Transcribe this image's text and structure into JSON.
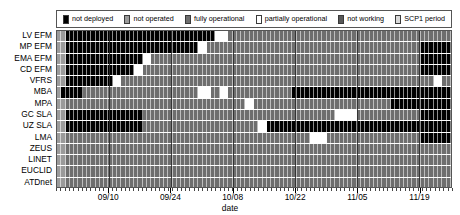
{
  "legend": {
    "items": [
      {
        "label": "not deployed",
        "color": "#000000",
        "name": "legend-not-deployed"
      },
      {
        "label": "not operated",
        "color": "#9a9a9a",
        "name": "legend-not-operated"
      },
      {
        "label": "fully operational",
        "color": "#6e6e6e",
        "name": "legend-fully-operational"
      },
      {
        "label": "partially operational",
        "color": "#ffffff",
        "name": "legend-partially-operational"
      },
      {
        "label": "not working",
        "color": "#585858",
        "name": "legend-not-working"
      },
      {
        "label": "SCP1 period",
        "color": "#d9d9d9",
        "name": "legend-scp1-period"
      }
    ]
  },
  "axes": {
    "xlabel": "date",
    "xticks": [
      "09/10",
      "09/24",
      "10/08",
      "10/22",
      "11/05",
      "11/19"
    ],
    "xtick_positions": [
      0.132,
      0.289,
      0.446,
      0.604,
      0.761,
      0.918
    ],
    "minor_tick_count": 92,
    "ylabels": [
      "LV EFM",
      "MP EFM",
      "EMA EFM",
      "CD EFM",
      "VFRS",
      "MBA",
      "MPA",
      "GC SLA",
      "UZ SLA",
      "LMA",
      "ZEUS",
      "LINET",
      "EUCLID",
      "ATDnet"
    ]
  },
  "chart_data": {
    "type": "heatmap",
    "title": "",
    "xlabel": "date",
    "ylabel": "",
    "grid": true,
    "legend_position": "top",
    "x_start": "09/03",
    "x_end": "11/28",
    "n_days": 92,
    "status_colors": {
      "not_deployed": "#000000",
      "not_operated": "#9a9a9a",
      "fully_operational": "#6e6e6e",
      "partially_operational": "#ffffff",
      "not_working": "#585858",
      "scp1_period": "#d9d9d9"
    },
    "categories": [
      "LV EFM",
      "MP EFM",
      "EMA EFM",
      "CD EFM",
      "VFRS",
      "MBA",
      "MPA",
      "GC SLA",
      "UZ SLA",
      "LMA",
      "ZEUS",
      "LINET",
      "EUCLID",
      "ATDnet"
    ],
    "series": [
      {
        "name": "LV EFM",
        "segments": [
          {
            "start": 0,
            "end": 2,
            "status": "not_operated"
          },
          {
            "start": 2,
            "end": 37,
            "status": "not_deployed"
          },
          {
            "start": 37,
            "end": 40,
            "status": "partially_operational"
          },
          {
            "start": 40,
            "end": 92,
            "status": "fully_operational"
          }
        ]
      },
      {
        "name": "MP EFM",
        "segments": [
          {
            "start": 0,
            "end": 2,
            "status": "not_operated"
          },
          {
            "start": 2,
            "end": 33,
            "status": "not_deployed"
          },
          {
            "start": 33,
            "end": 35,
            "status": "partially_operational"
          },
          {
            "start": 35,
            "end": 85,
            "status": "fully_operational"
          },
          {
            "start": 85,
            "end": 92,
            "status": "not_deployed"
          }
        ]
      },
      {
        "name": "EMA EFM",
        "segments": [
          {
            "start": 0,
            "end": 2,
            "status": "not_operated"
          },
          {
            "start": 2,
            "end": 20,
            "status": "not_deployed"
          },
          {
            "start": 20,
            "end": 22,
            "status": "partially_operational"
          },
          {
            "start": 22,
            "end": 85,
            "status": "fully_operational"
          },
          {
            "start": 85,
            "end": 92,
            "status": "not_deployed"
          }
        ]
      },
      {
        "name": "CD EFM",
        "segments": [
          {
            "start": 0,
            "end": 2,
            "status": "not_operated"
          },
          {
            "start": 2,
            "end": 18,
            "status": "not_deployed"
          },
          {
            "start": 18,
            "end": 20,
            "status": "partially_operational"
          },
          {
            "start": 20,
            "end": 85,
            "status": "fully_operational"
          },
          {
            "start": 85,
            "end": 92,
            "status": "not_deployed"
          }
        ]
      },
      {
        "name": "VFRS",
        "segments": [
          {
            "start": 0,
            "end": 2,
            "status": "not_operated"
          },
          {
            "start": 2,
            "end": 13,
            "status": "not_deployed"
          },
          {
            "start": 13,
            "end": 15,
            "status": "partially_operational"
          },
          {
            "start": 15,
            "end": 88,
            "status": "fully_operational"
          },
          {
            "start": 88,
            "end": 90,
            "status": "partially_operational"
          },
          {
            "start": 90,
            "end": 92,
            "status": "fully_operational"
          }
        ]
      },
      {
        "name": "MBA",
        "segments": [
          {
            "start": 0,
            "end": 1,
            "status": "not_operated"
          },
          {
            "start": 1,
            "end": 6,
            "status": "not_deployed"
          },
          {
            "start": 6,
            "end": 33,
            "status": "fully_operational"
          },
          {
            "start": 33,
            "end": 36,
            "status": "partially_operational"
          },
          {
            "start": 36,
            "end": 38,
            "status": "fully_operational"
          },
          {
            "start": 38,
            "end": 40,
            "status": "partially_operational"
          },
          {
            "start": 40,
            "end": 55,
            "status": "fully_operational"
          },
          {
            "start": 55,
            "end": 92,
            "status": "not_deployed"
          }
        ]
      },
      {
        "name": "MPA",
        "segments": [
          {
            "start": 0,
            "end": 2,
            "status": "not_operated"
          },
          {
            "start": 2,
            "end": 44,
            "status": "fully_operational"
          },
          {
            "start": 44,
            "end": 46,
            "status": "partially_operational"
          },
          {
            "start": 46,
            "end": 78,
            "status": "fully_operational"
          },
          {
            "start": 78,
            "end": 92,
            "status": "not_deployed"
          }
        ]
      },
      {
        "name": "GC SLA",
        "segments": [
          {
            "start": 0,
            "end": 2,
            "status": "not_operated"
          },
          {
            "start": 2,
            "end": 20,
            "status": "not_deployed"
          },
          {
            "start": 20,
            "end": 65,
            "status": "fully_operational"
          },
          {
            "start": 65,
            "end": 70,
            "status": "partially_operational"
          },
          {
            "start": 70,
            "end": 85,
            "status": "fully_operational"
          },
          {
            "start": 85,
            "end": 92,
            "status": "not_deployed"
          }
        ]
      },
      {
        "name": "UZ SLA",
        "segments": [
          {
            "start": 0,
            "end": 2,
            "status": "not_operated"
          },
          {
            "start": 2,
            "end": 20,
            "status": "not_deployed"
          },
          {
            "start": 20,
            "end": 47,
            "status": "fully_operational"
          },
          {
            "start": 47,
            "end": 49,
            "status": "partially_operational"
          },
          {
            "start": 49,
            "end": 92,
            "status": "not_deployed"
          }
        ]
      },
      {
        "name": "LMA",
        "segments": [
          {
            "start": 0,
            "end": 2,
            "status": "not_operated"
          },
          {
            "start": 2,
            "end": 59,
            "status": "fully_operational"
          },
          {
            "start": 59,
            "end": 63,
            "status": "partially_operational"
          },
          {
            "start": 63,
            "end": 85,
            "status": "fully_operational"
          },
          {
            "start": 85,
            "end": 92,
            "status": "not_deployed"
          }
        ]
      },
      {
        "name": "ZEUS",
        "segments": [
          {
            "start": 0,
            "end": 2,
            "status": "not_operated"
          },
          {
            "start": 2,
            "end": 92,
            "status": "fully_operational"
          }
        ]
      },
      {
        "name": "LINET",
        "segments": [
          {
            "start": 0,
            "end": 2,
            "status": "not_operated"
          },
          {
            "start": 2,
            "end": 92,
            "status": "fully_operational"
          }
        ]
      },
      {
        "name": "EUCLID",
        "segments": [
          {
            "start": 0,
            "end": 2,
            "status": "not_operated"
          },
          {
            "start": 2,
            "end": 92,
            "status": "fully_operational"
          }
        ]
      },
      {
        "name": "ATDnet",
        "segments": [
          {
            "start": 0,
            "end": 2,
            "status": "not_operated"
          },
          {
            "start": 2,
            "end": 92,
            "status": "fully_operational"
          }
        ]
      }
    ]
  }
}
